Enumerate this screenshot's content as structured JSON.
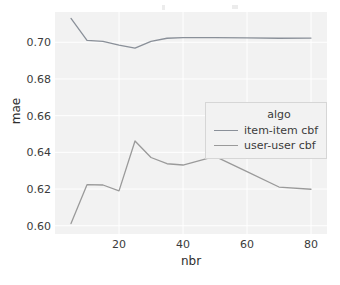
{
  "chart_data": {
    "type": "line",
    "title": "",
    "xlabel": "nbr",
    "ylabel": "mae",
    "xlim": [
      0,
      85
    ],
    "ylim": [
      0.5955,
      0.7165
    ],
    "xticks": [
      20,
      40,
      60,
      80
    ],
    "xtick_labels": [
      "20",
      "40",
      "60",
      "80"
    ],
    "yticks": [
      0.6,
      0.62,
      0.64,
      0.66,
      0.68,
      0.7
    ],
    "ytick_labels": [
      "0.60",
      "0.62",
      "0.64",
      "0.66",
      "0.68",
      "0.70"
    ],
    "grid": true,
    "grid_color": "#ffffff",
    "plot_background": "#f2f2f2",
    "legend_position": "center-right",
    "legend": {
      "title": "algo",
      "entries": [
        {
          "label": "item-item cbf",
          "color": "#8a9099"
        },
        {
          "label": "user-user cbf",
          "color": "#9a9a9a"
        }
      ]
    },
    "x": [
      5,
      10,
      15,
      20,
      25,
      30,
      35,
      40,
      50,
      60,
      70,
      80
    ],
    "series": [
      {
        "name": "item-item cbf",
        "color": "#8a9099",
        "values": [
          0.713,
          0.701,
          0.7005,
          0.6985,
          0.6968,
          0.7005,
          0.7022,
          0.7025,
          0.7025,
          0.7024,
          0.7022,
          0.7023
        ]
      },
      {
        "name": "user-user cbf",
        "color": "#9a9a9a",
        "values": [
          0.6012,
          0.6224,
          0.6222,
          0.619,
          0.6462,
          0.6372,
          0.6338,
          0.6331,
          0.6378,
          0.6295,
          0.6211,
          0.6199
        ]
      }
    ]
  },
  "axes": {
    "xlabel": "nbr",
    "ylabel": "mae"
  }
}
